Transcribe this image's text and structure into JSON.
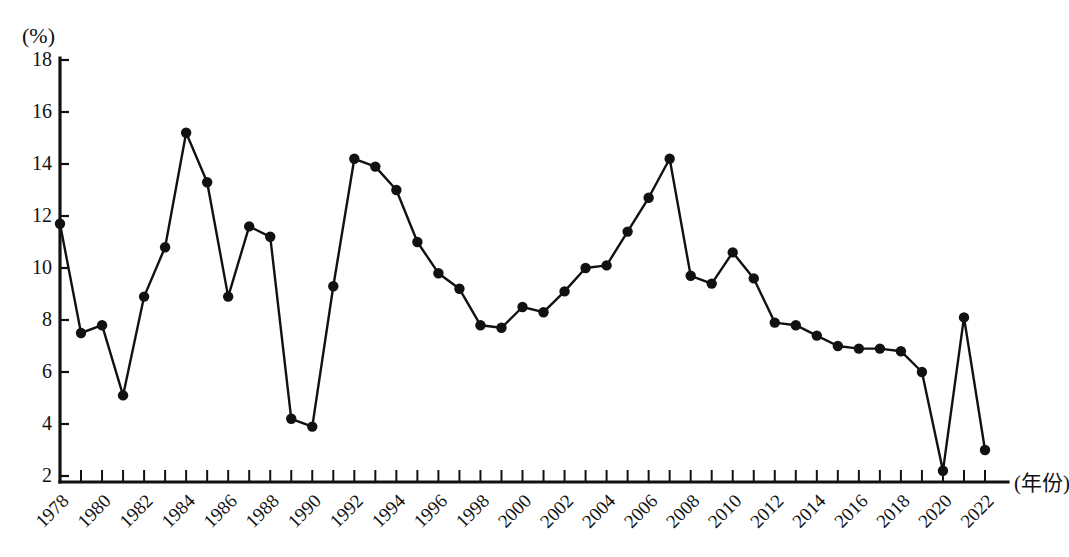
{
  "chart_data": {
    "type": "line",
    "title": "",
    "subtitle": "",
    "xlabel": "(年份)",
    "ylabel": "(%)",
    "y_unit_label": "(%)",
    "x_axis_caption": "(年份)",
    "xlim": [
      1978,
      2022
    ],
    "ylim": [
      2,
      18
    ],
    "ytick_step": 2,
    "xtick_step": 1,
    "xtick_label_step": 2,
    "grid": false,
    "legend": null,
    "legend_position": "none",
    "marker": "filled-circle",
    "line_color": "#111111",
    "marker_color": "#111111",
    "yticks": [
      2,
      4,
      6,
      8,
      10,
      12,
      14,
      16,
      18
    ],
    "xtick_labels": [
      "1978",
      "1980",
      "1982",
      "1984",
      "1986",
      "1988",
      "1990",
      "1992",
      "1994",
      "1996",
      "1998",
      "2000",
      "2002",
      "2004",
      "2006",
      "2008",
      "2010",
      "2012",
      "2014",
      "2016",
      "2018",
      "2020",
      "2022"
    ],
    "x": [
      1978,
      1979,
      1980,
      1981,
      1982,
      1983,
      1984,
      1985,
      1986,
      1987,
      1988,
      1989,
      1990,
      1991,
      1992,
      1993,
      1994,
      1995,
      1996,
      1997,
      1998,
      1999,
      2000,
      2001,
      2002,
      2003,
      2004,
      2005,
      2006,
      2007,
      2008,
      2009,
      2010,
      2011,
      2012,
      2013,
      2014,
      2015,
      2016,
      2017,
      2018,
      2019,
      2020,
      2021,
      2022
    ],
    "values": [
      11.7,
      7.5,
      7.8,
      5.1,
      8.9,
      10.8,
      15.2,
      13.3,
      8.9,
      11.6,
      11.2,
      4.2,
      3.9,
      9.3,
      14.2,
      13.9,
      13.0,
      11.0,
      9.8,
      9.2,
      7.8,
      7.7,
      8.5,
      8.3,
      9.1,
      10.0,
      10.1,
      11.4,
      12.7,
      14.2,
      9.7,
      9.4,
      10.6,
      9.6,
      7.9,
      7.8,
      7.4,
      7.0,
      6.9,
      6.9,
      6.8,
      6.0,
      2.2,
      8.1,
      3.0
    ],
    "series": [
      {
        "name": "",
        "values": [
          11.7,
          7.5,
          7.8,
          5.1,
          8.9,
          10.8,
          15.2,
          13.3,
          8.9,
          11.6,
          11.2,
          4.2,
          3.9,
          9.3,
          14.2,
          13.9,
          13.0,
          11.0,
          9.8,
          9.2,
          7.8,
          7.7,
          8.5,
          8.3,
          9.1,
          10.0,
          10.1,
          11.4,
          12.7,
          14.2,
          9.7,
          9.4,
          10.6,
          9.6,
          7.9,
          7.8,
          7.4,
          7.0,
          6.9,
          6.9,
          6.8,
          6.0,
          2.2,
          8.1,
          3.0
        ]
      }
    ]
  }
}
